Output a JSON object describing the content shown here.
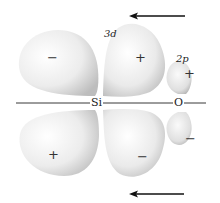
{
  "diagram": {
    "title": "",
    "bond_axis": {
      "left_atom": "Si",
      "right_atom": "O"
    },
    "orbital_labels": {
      "si_orbital": "3d",
      "o_orbital": "2p"
    },
    "lobes": {
      "si_top_left": "−",
      "si_top_right": "+",
      "si_bottom_left": "+",
      "si_bottom_right": "−",
      "o_top": "+",
      "o_bottom": "−"
    },
    "arrows": {
      "top_direction": "left",
      "bottom_direction": "left"
    },
    "colors": {
      "lobe_light": "#ffffff",
      "lobe_shade": "#c8c8c8",
      "line": "#222222"
    }
  }
}
